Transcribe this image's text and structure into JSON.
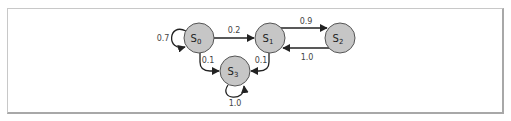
{
  "diagram": {
    "type": "markov-chain",
    "colors": {
      "node_fill": "#c6c6c6",
      "node_stroke": "#555555",
      "edge": "#222222",
      "label": "#444444"
    },
    "nodes": [
      {
        "id": "S0",
        "base": "S",
        "sub": "0",
        "cx": 199,
        "cy": 38
      },
      {
        "id": "S1",
        "base": "S",
        "sub": "1",
        "cx": 270,
        "cy": 38
      },
      {
        "id": "S2",
        "base": "S",
        "sub": "2",
        "cx": 340,
        "cy": 38
      },
      {
        "id": "S3",
        "base": "S",
        "sub": "3",
        "cx": 235,
        "cy": 71
      }
    ],
    "edges": [
      {
        "from": "S0",
        "to": "S0",
        "label": "0.7"
      },
      {
        "from": "S0",
        "to": "S1",
        "label": "0.2"
      },
      {
        "from": "S0",
        "to": "S3",
        "label": "0.1"
      },
      {
        "from": "S1",
        "to": "S2",
        "label": "0.9"
      },
      {
        "from": "S1",
        "to": "S3",
        "label": "0.1"
      },
      {
        "from": "S2",
        "to": "S1",
        "label": "1.0"
      },
      {
        "from": "S3",
        "to": "S3",
        "label": "1.0"
      }
    ]
  }
}
